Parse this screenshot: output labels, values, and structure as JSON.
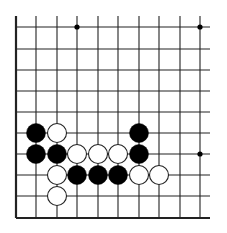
{
  "board": {
    "columns": 10,
    "rows": 10,
    "col_x": [
      16,
      36,
      57,
      77,
      98,
      118,
      139,
      159,
      180,
      200
    ],
    "row_y": [
      27,
      49,
      70,
      91,
      112,
      133,
      154,
      175,
      196,
      218
    ],
    "line_top": 16,
    "line_right": 210,
    "left_edge": true,
    "bottom_edge": true,
    "line_color": "#222222",
    "background": "#ffffff",
    "star_points": [
      {
        "col": 3,
        "row": 0
      },
      {
        "col": 9,
        "row": 0
      },
      {
        "col": 9,
        "row": 6
      }
    ]
  },
  "stones": [
    {
      "color": "black",
      "col": 1,
      "row": 5
    },
    {
      "color": "white",
      "col": 2,
      "row": 5
    },
    {
      "color": "black",
      "col": 6,
      "row": 5
    },
    {
      "color": "black",
      "col": 1,
      "row": 6
    },
    {
      "color": "black",
      "col": 2,
      "row": 6
    },
    {
      "color": "white",
      "col": 3,
      "row": 6
    },
    {
      "color": "white",
      "col": 4,
      "row": 6
    },
    {
      "color": "white",
      "col": 5,
      "row": 6
    },
    {
      "color": "black",
      "col": 6,
      "row": 6
    },
    {
      "color": "white",
      "col": 2,
      "row": 7
    },
    {
      "color": "black",
      "col": 3,
      "row": 7
    },
    {
      "color": "black",
      "col": 4,
      "row": 7
    },
    {
      "color": "black",
      "col": 5,
      "row": 7
    },
    {
      "color": "white",
      "col": 6,
      "row": 7
    },
    {
      "color": "white",
      "col": 7,
      "row": 7
    },
    {
      "color": "white",
      "col": 2,
      "row": 8
    }
  ],
  "stone_radius": 9.5,
  "colors": {
    "black_stone": "#000000",
    "white_stone": "#ffffff",
    "white_stone_outline": "#222222"
  }
}
